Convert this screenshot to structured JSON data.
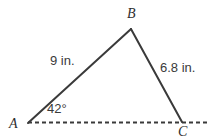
{
  "figure": {
    "kind": "triangle-diagram",
    "background_color": "#ffffff",
    "stroke_color": "#3a3a3a",
    "text_color": "#3a3a3a",
    "vertex_label_color": "#2e2e2e",
    "vertices": {
      "A": {
        "label": "A",
        "x": 28,
        "y": 123
      },
      "B": {
        "label": "B",
        "x": 131,
        "y": 29
      },
      "C": {
        "label": "C",
        "x": 182,
        "y": 122
      }
    },
    "sides": [
      {
        "name": "AB",
        "from": "A",
        "to": "B",
        "style": "solid",
        "length_label": "9 in."
      },
      {
        "name": "BC",
        "from": "B",
        "to": "C",
        "style": "solid",
        "length_label": "6.8 in."
      },
      {
        "name": "AC",
        "from": "A",
        "to": "C",
        "style": "dashed",
        "length_label": ""
      }
    ],
    "angles": [
      {
        "at": "A",
        "label": "42°",
        "value": 42,
        "unit": "degrees"
      }
    ],
    "baseline": {
      "style": "dashed",
      "x_start": 28,
      "x_end": 208,
      "y": 122,
      "dash_length": 4,
      "dash_gap": 3
    }
  }
}
